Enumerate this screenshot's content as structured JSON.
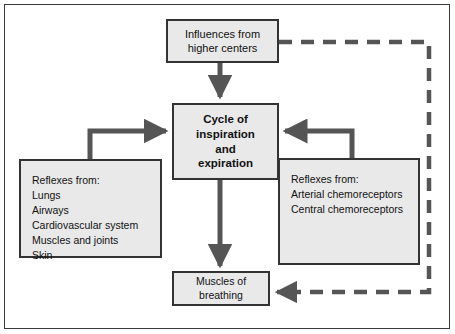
{
  "figure": {
    "kind": "flow-diagram",
    "title_visible": false,
    "background_color": "#ffffff",
    "frame_color": "#3a3a3a",
    "box_fill_color": "#e9e9e9",
    "box_border_color": "#333333",
    "arrow_color": "#555555",
    "dashed_arrow_color": "#555555",
    "text_color": "#111111"
  },
  "boxes": {
    "higher_centers": {
      "lines": [
        "Influences from",
        "higher centers"
      ],
      "line1": "Influences from",
      "line2": "higher centers"
    },
    "cycle": {
      "lines": [
        "Cycle of",
        "inspiration",
        "and",
        "expiration"
      ],
      "line1": "Cycle of",
      "line2": "inspiration",
      "line3": "and",
      "line4": "expiration"
    },
    "reflexes_peripheral": {
      "heading": "Reflexes from:",
      "items": [
        "Lungs",
        "Airways",
        "Cardiovascular system",
        "Muscles and joints",
        "Skin"
      ],
      "item1": "Lungs",
      "item2": "Airways",
      "item3": "Cardiovascular system",
      "item4": "Muscles and joints",
      "item5": "Skin"
    },
    "reflexes_chemo": {
      "heading": "Reflexes from:",
      "items": [
        "Arterial chemoreceptors",
        "Central chemoreceptors"
      ],
      "item1": "Arterial chemoreceptors",
      "item2": "Central chemoreceptors"
    },
    "muscles_of_breathing": {
      "lines": [
        "Muscles of",
        "breathing"
      ],
      "line1": "Muscles of",
      "line2": "breathing"
    }
  },
  "connectors": [
    {
      "name": "higher-centers-to-cycle",
      "style": "solid",
      "from": "higher_centers",
      "to": "cycle",
      "direction": "down"
    },
    {
      "name": "peripheral-reflexes-to-cycle",
      "style": "solid",
      "from": "reflexes_peripheral",
      "to": "cycle",
      "direction": "up-then-right"
    },
    {
      "name": "chemoreflexes-to-cycle",
      "style": "solid",
      "from": "reflexes_chemo",
      "to": "cycle",
      "direction": "up-then-left"
    },
    {
      "name": "cycle-to-muscles",
      "style": "solid",
      "from": "cycle",
      "to": "muscles_of_breathing",
      "direction": "down"
    },
    {
      "name": "higher-centers-feedback-to-muscles",
      "style": "dashed",
      "from": "higher_centers",
      "to": "muscles_of_breathing",
      "direction": "right-down-left"
    }
  ]
}
